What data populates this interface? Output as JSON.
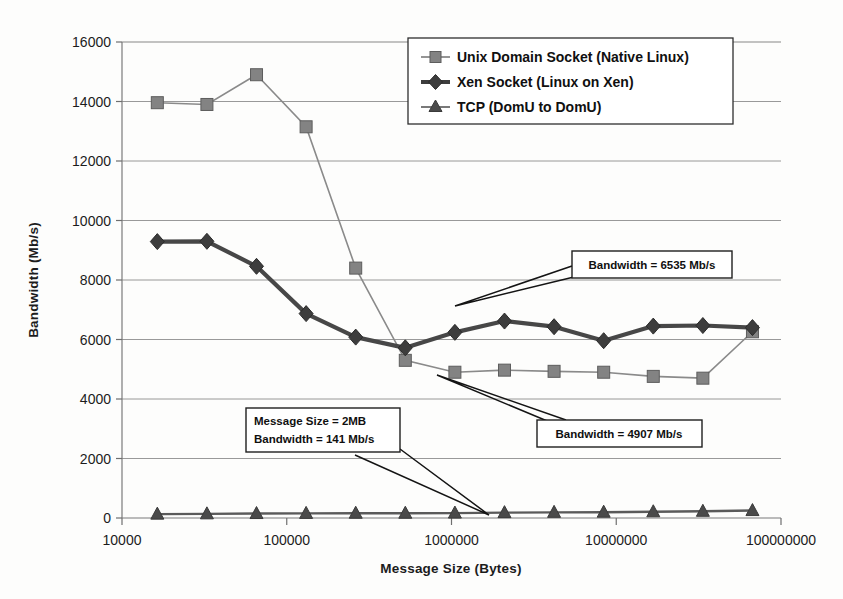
{
  "chart_data": {
    "type": "line",
    "title": "",
    "xlabel": "Message Size (Bytes)",
    "ylabel": "Bandwidth (Mb/s)",
    "xscale": "log",
    "xlim": [
      10000,
      100000000
    ],
    "ylim": [
      0,
      16000
    ],
    "grid": true,
    "legend_position": "top-right",
    "x": [
      16384,
      32768,
      65536,
      131072,
      262144,
      524288,
      1048576,
      2097152,
      4194304,
      8388608,
      16777216,
      33554432,
      67108864
    ],
    "xtick_labels": [
      "10000",
      "100000",
      "1000000",
      "10000000",
      "100000000"
    ],
    "xtick_values": [
      10000,
      100000,
      1000000,
      10000000,
      100000000
    ],
    "ytick_labels": [
      "0",
      "2000",
      "4000",
      "6000",
      "8000",
      "10000",
      "12000",
      "14000",
      "16000"
    ],
    "ytick_values": [
      0,
      2000,
      4000,
      6000,
      8000,
      10000,
      12000,
      14000,
      16000
    ],
    "series": [
      {
        "name": "Unix Domain Socket (Native Linux)",
        "marker": "square",
        "color": "#838383",
        "values": [
          13960,
          13900,
          14900,
          13150,
          8400,
          5300,
          4900,
          4970,
          4930,
          4900,
          4760,
          4700,
          6260
        ]
      },
      {
        "name": "Xen Socket (Linux on Xen)",
        "marker": "diamond",
        "color": "#3d3d3d",
        "values": [
          9290,
          9300,
          8460,
          6870,
          6080,
          5720,
          6240,
          6620,
          6430,
          5960,
          6450,
          6470,
          6400
        ]
      },
      {
        "name": "TCP (DomU to DomU)",
        "marker": "triangle",
        "color": "#4a4a4a",
        "values": [
          130,
          140,
          150,
          155,
          160,
          160,
          165,
          180,
          190,
          195,
          210,
          225,
          250
        ]
      }
    ],
    "annotations": [
      {
        "id": "xen-peak",
        "lines": [
          "Bandwidth = 6535 Mb/s"
        ],
        "target_series": "Xen Socket (Linux on Xen)"
      },
      {
        "id": "unix-plateau",
        "lines": [
          "Bandwidth = 4907 Mb/s"
        ],
        "target_series": "Unix Domain Socket (Native Linux)"
      },
      {
        "id": "tcp-2mb",
        "lines": [
          "Message Size = 2MB",
          "Bandwidth = 141 Mb/s"
        ],
        "target_series": "TCP (DomU to DomU)"
      }
    ]
  },
  "legend": {
    "entries": [
      {
        "label": "Unix Domain Socket (Native Linux)"
      },
      {
        "label": "Xen Socket (Linux on Xen)"
      },
      {
        "label": "TCP (DomU to DomU)"
      }
    ]
  },
  "axes": {
    "x_title": "Message Size (Bytes)",
    "y_title": "Bandwidth (Mb/s)",
    "x_ticks": [
      "10000",
      "100000",
      "1000000",
      "10000000",
      "100000000"
    ],
    "y_ticks": [
      "16000",
      "14000",
      "12000",
      "10000",
      "8000",
      "6000",
      "4000",
      "2000",
      "0"
    ]
  },
  "annotations": {
    "a1_line1": "Bandwidth = 6535 Mb/s",
    "a2_line1": "Bandwidth = 4907 Mb/s",
    "a3_line1": "Message Size = 2MB",
    "a3_line2": "Bandwidth = 141 Mb/s"
  },
  "colors": {
    "unix": "#838383",
    "xen": "#3d3d3d",
    "tcp": "#4a4a4a",
    "grid": "#8d8d8d",
    "background": "#fdfdfc"
  }
}
